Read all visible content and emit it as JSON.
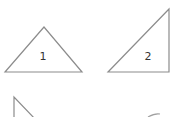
{
  "diagram": {
    "title": "",
    "stroke_color": "#8c8c8c",
    "label_color": "#333333",
    "shapes": [
      {
        "id": "triangle-1",
        "type": "isosceles-triangle",
        "label": "1"
      },
      {
        "id": "triangle-2",
        "type": "right-triangle",
        "label": "2"
      },
      {
        "id": "triangle-3",
        "type": "right-triangle",
        "label": "",
        "partially_visible": true
      },
      {
        "id": "shape-4",
        "type": "unknown",
        "label": "",
        "partially_visible": true
      }
    ]
  }
}
